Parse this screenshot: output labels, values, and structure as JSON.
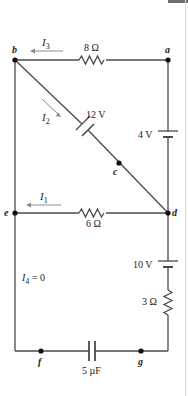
{
  "diagram": {
    "type": "circuit-schematic",
    "nodes": [
      {
        "id": "a",
        "label": "a"
      },
      {
        "id": "b",
        "label": "b"
      },
      {
        "id": "c",
        "label": "c"
      },
      {
        "id": "d",
        "label": "d"
      },
      {
        "id": "e",
        "label": "e"
      },
      {
        "id": "f",
        "label": "f"
      },
      {
        "id": "g",
        "label": "g"
      }
    ],
    "components": {
      "r_top": {
        "label": "8 Ω",
        "type": "resistor",
        "between": [
          "b",
          "a"
        ]
      },
      "r_mid": {
        "label": "6 Ω",
        "type": "resistor",
        "between": [
          "e",
          "d"
        ]
      },
      "r_right": {
        "label": "3 Ω",
        "type": "resistor",
        "between": [
          "d",
          "g"
        ]
      },
      "emf_diag": {
        "label": "12 V",
        "type": "battery",
        "between": [
          "b",
          "c"
        ]
      },
      "emf_right_top": {
        "label": "4 V",
        "type": "battery",
        "between": [
          "a",
          "d"
        ]
      },
      "emf_right_bottom": {
        "label": "10 V",
        "type": "battery",
        "between": [
          "d",
          "g"
        ]
      },
      "cap_bottom": {
        "label": "5 µF",
        "type": "capacitor",
        "between": [
          "f",
          "g"
        ]
      }
    },
    "currents": {
      "i3": {
        "symbol": "I",
        "sub": "3",
        "direction": "left"
      },
      "i2": {
        "symbol": "I",
        "sub": "2",
        "direction": "down-right"
      },
      "i1": {
        "symbol": "I",
        "sub": "1",
        "direction": "left"
      },
      "i4": {
        "symbol": "I",
        "sub": "4",
        "suffix": " = 0"
      }
    },
    "colors": {
      "wire": "#4a4a4a",
      "arrow": "#8a8a8a",
      "text": "#222222"
    }
  }
}
